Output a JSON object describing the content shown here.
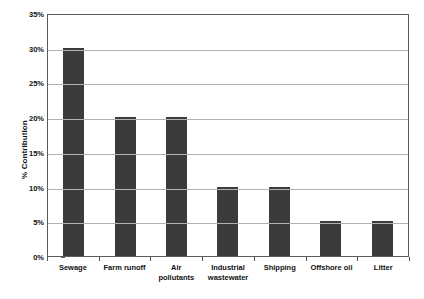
{
  "chart_data": {
    "type": "bar",
    "title": "",
    "xlabel": "",
    "ylabel": "% Contribution",
    "categories": [
      "Sewage",
      "Farm runoff",
      "Air\npollutants",
      "Industrial\nwastewater",
      "Shipping",
      "Offshore oil",
      "Litter"
    ],
    "values": [
      30,
      20,
      20,
      10,
      10,
      5,
      5
    ],
    "ylim": [
      0,
      35
    ],
    "ytick_values": [
      0,
      5,
      10,
      15,
      20,
      25,
      30,
      35
    ],
    "ytick_labels": [
      "0%",
      "5%",
      "10%",
      "15%",
      "20%",
      "25%",
      "30%",
      "35%"
    ],
    "grid": "horizontal",
    "legend": "none",
    "bar_color": "#3b3b3b",
    "grid_color": "#b0b0b0",
    "axis_color": "#5a5a5a",
    "background_color": "#ffffff"
  }
}
